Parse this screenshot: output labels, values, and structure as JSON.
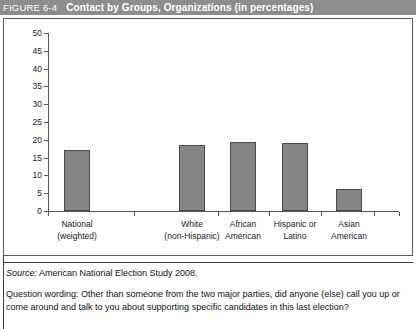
{
  "header": {
    "figure_number": "FIGURE 6-4",
    "title": "Contact by Groups, Organizations (in percentages)",
    "background_color": "#8d8d8d",
    "text_color": "#ffffff"
  },
  "notes": {
    "source_label": "Source:",
    "source_text": " American National Election Study 2008.",
    "question_text": "Question wording: Other than someone from the two major parties, did anyone (else) call you up or come around and talk to you about supporting specific candidates in this last election?"
  },
  "chart_data": {
    "type": "bar",
    "title": "Contact by Groups, Organizations (in percentages)",
    "categories": [
      "National\n(weighted)",
      "White\n(non-Hispanic)",
      "African\nAmerican",
      "Hispanic or\nLatino",
      "Asian\nAmerican"
    ],
    "category_lines": [
      [
        "National",
        "(weighted)"
      ],
      [
        "White",
        "(non-Hispanic)"
      ],
      [
        "African",
        "American"
      ],
      [
        "Hispanic or",
        "Latino"
      ],
      [
        "Asian",
        "American"
      ]
    ],
    "values": [
      17,
      18.5,
      19.5,
      19,
      6.3
    ],
    "xlabel": "",
    "ylabel": "",
    "ylim": [
      0,
      50
    ],
    "yticks": [
      0,
      5,
      10,
      15,
      20,
      25,
      30,
      35,
      40,
      45,
      50
    ],
    "ytick_labels": [
      "0",
      "5",
      "10",
      "15",
      "20",
      "25",
      "30",
      "35",
      "40",
      "45",
      "50"
    ],
    "grid": false,
    "legend": null,
    "bar_color": "#858585",
    "bar_border_color": "#4a4a4a",
    "axis_color": "#555555"
  }
}
